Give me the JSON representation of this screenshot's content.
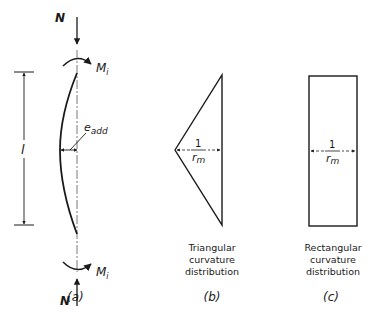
{
  "figure": {
    "panel_a": {
      "caption": "(a)",
      "axial_load_top": "N",
      "axial_load_bottom": "N",
      "moment_top": "M",
      "moment_top_sub": "i",
      "moment_bottom": "M",
      "moment_bottom_sub": "i",
      "length_label": "l",
      "eccentricity_label": "e",
      "eccentricity_sub": "add"
    },
    "panel_b": {
      "caption": "(b)",
      "curvature_num": "1",
      "curvature_den": "r",
      "curvature_den_sub": "m",
      "title_lines": [
        "Triangular",
        "curvature",
        "distribution"
      ]
    },
    "panel_c": {
      "caption": "(c)",
      "curvature_num": "1",
      "curvature_den": "r",
      "curvature_den_sub": "m",
      "title_lines": [
        "Rectangular",
        "curvature",
        "distribution"
      ]
    }
  }
}
